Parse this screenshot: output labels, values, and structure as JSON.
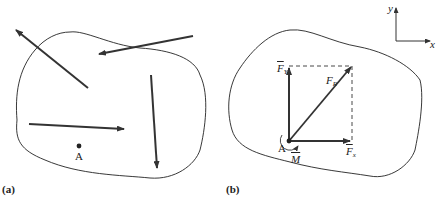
{
  "figure_a": {
    "caption": "(a)",
    "point_label": "A"
  },
  "figure_b": {
    "caption": "(b)",
    "point_label": "A",
    "fy_label": "F",
    "fy_sub": "Y",
    "fr_label": "F",
    "fr_sub": "R",
    "fx_label": "F",
    "fx_sub": "x",
    "moment_label": "M"
  },
  "axes": {
    "y_label": "y",
    "x_label": "x"
  },
  "colors": {
    "line": "#222222",
    "arrow": "#333333"
  }
}
